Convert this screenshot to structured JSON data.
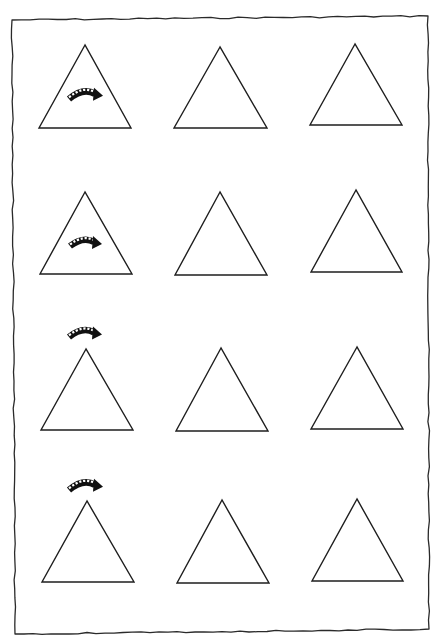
{
  "worksheet": {
    "title": "",
    "layout": {
      "rows": 4,
      "columns": 3
    },
    "frame": {
      "style": "hand-drawn border",
      "corners": {
        "top_left": [
          12,
          20
        ],
        "top_right": [
          428,
          16
        ],
        "bottom_right": [
          429,
          629
        ],
        "bottom_left": [
          15,
          634
        ]
      },
      "stroke_color": "#2a2a2a"
    },
    "triangle_color": "#1e1e1e",
    "arrow_color": "#111111",
    "rows": [
      {
        "index": 1,
        "arrow": {
          "icon": "curved-dotted-arrow-icon",
          "position": "inside-triangle",
          "box": [
            67,
            88,
            103,
            101
          ]
        },
        "triangles": [
          {
            "apex": [
              85,
              45
            ],
            "base_left": [
              39,
              128
            ],
            "base_right": [
              131,
              128
            ]
          },
          {
            "apex": [
              220,
              47
            ],
            "base_left": [
              174,
              128
            ],
            "base_right": [
              267,
              128
            ]
          },
          {
            "apex": [
              355,
              44
            ],
            "base_left": [
              310,
              125
            ],
            "base_right": [
              402,
              125
            ]
          }
        ]
      },
      {
        "index": 2,
        "arrow": {
          "icon": "curved-dotted-arrow-icon",
          "position": "inside-triangle",
          "box": [
            68,
            237,
            102,
            248
          ]
        },
        "triangles": [
          {
            "apex": [
              85,
              192
            ],
            "base_left": [
              40,
              274
            ],
            "base_right": [
              132,
              274
            ]
          },
          {
            "apex": [
              220,
              192
            ],
            "base_left": [
              175,
              275
            ],
            "base_right": [
              267,
              275
            ]
          },
          {
            "apex": [
              356,
              190
            ],
            "base_left": [
              311,
              272
            ],
            "base_right": [
              402,
              272
            ]
          }
        ]
      },
      {
        "index": 3,
        "arrow": {
          "icon": "curved-dotted-arrow-icon",
          "position": "above-triangle",
          "box": [
            67,
            327,
            102,
            339
          ]
        },
        "triangles": [
          {
            "apex": [
              86,
              349
            ],
            "base_left": [
              41,
              430
            ],
            "base_right": [
              133,
              430
            ]
          },
          {
            "apex": [
              221,
              348
            ],
            "base_left": [
              176,
              431
            ],
            "base_right": [
              268,
              431
            ]
          },
          {
            "apex": [
              357,
              347
            ],
            "base_left": [
              311,
              429
            ],
            "base_right": [
              403,
              429
            ]
          }
        ]
      },
      {
        "index": 4,
        "arrow": {
          "icon": "curved-dotted-arrow-icon",
          "position": "above-triangle",
          "box": [
            67,
            479,
            103,
            492
          ]
        },
        "triangles": [
          {
            "apex": [
              87,
              501
            ],
            "base_left": [
              42,
              582
            ],
            "base_right": [
              134,
              582
            ]
          },
          {
            "apex": [
              222,
              500
            ],
            "base_left": [
              177,
              583
            ],
            "base_right": [
              269,
              583
            ]
          },
          {
            "apex": [
              357,
              499
            ],
            "base_left": [
              312,
              581
            ],
            "base_right": [
              403,
              581
            ]
          }
        ]
      }
    ]
  }
}
